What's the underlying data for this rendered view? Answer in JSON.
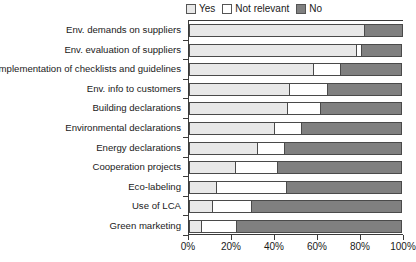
{
  "chart_data": {
    "type": "bar",
    "orientation": "horizontal",
    "stacked": true,
    "normalized": true,
    "title": "",
    "xlabel": "",
    "ylabel": "",
    "xlim": [
      0,
      100
    ],
    "xticks": [
      "0%",
      "20%",
      "40%",
      "60%",
      "80%",
      "100%"
    ],
    "xtick_values": [
      0,
      20,
      40,
      60,
      80,
      100
    ],
    "grid": false,
    "legend_position": "top-right",
    "categories": [
      "Env. demands on suppliers",
      "Env. evaluation of suppliers",
      "Implementation of checklists and guidelines",
      "Env. info to customers",
      "Building declarations",
      "Environmental declarations",
      "Energy declarations",
      "Cooperation projects",
      "Eco-labeling",
      "Use of LCA",
      "Green marketing"
    ],
    "series": [
      {
        "name": "Yes",
        "color": "#e8e8e8",
        "values": [
          82,
          78,
          58,
          47,
          46,
          40,
          32,
          22,
          13,
          11,
          6
        ]
      },
      {
        "name": "Not relevant",
        "color": "#ffffff",
        "values": [
          0,
          3,
          13,
          18,
          16,
          13,
          13,
          20,
          33,
          19,
          17
        ]
      },
      {
        "name": "No",
        "color": "#808080",
        "values": [
          18,
          19,
          29,
          35,
          38,
          47,
          55,
          58,
          54,
          70,
          77
        ]
      }
    ]
  },
  "legend": {
    "entries": [
      {
        "label": "Yes",
        "color": "#e8e8e8"
      },
      {
        "label": "Not relevant",
        "color": "#ffffff"
      },
      {
        "label": "No",
        "color": "#808080"
      }
    ]
  },
  "colors": {
    "yes": "#e8e8e8",
    "not_relevant": "#ffffff",
    "no": "#808080",
    "axis": "#3a3a3a",
    "bar_border": "#4a4a4a",
    "background": "#ffffff"
  }
}
